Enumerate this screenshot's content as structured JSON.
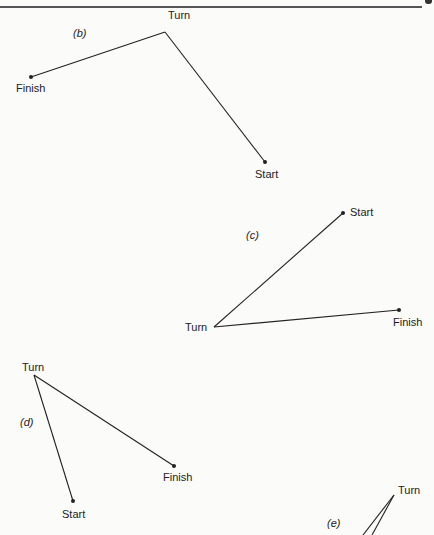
{
  "header": {
    "rule": true
  },
  "panels": [
    {
      "id": "b",
      "label": "(b)",
      "label_pos": [
        73,
        27
      ],
      "points": {
        "start": {
          "label": "Start",
          "x": 265,
          "y": 162,
          "label_pos": [
            255,
            168
          ]
        },
        "turn": {
          "label": "Turn",
          "x": 165,
          "y": 32,
          "label_pos": [
            168,
            9
          ]
        },
        "finish": {
          "label": "Finish",
          "x": 31,
          "y": 77,
          "label_pos": [
            16,
            82
          ]
        }
      }
    },
    {
      "id": "c",
      "label": "(c)",
      "label_pos": [
        246,
        229
      ],
      "points": {
        "start": {
          "label": "Start",
          "x": 343,
          "y": 213,
          "label_pos": [
            350,
            206
          ]
        },
        "turn": {
          "label": "Turn",
          "x": 214,
          "y": 327,
          "label_pos": [
            185,
            321
          ]
        },
        "finish": {
          "label": "Finish",
          "x": 399,
          "y": 310,
          "label_pos": [
            393,
            316
          ]
        }
      }
    },
    {
      "id": "d",
      "label": "(d)",
      "label_pos": [
        20,
        416
      ],
      "points": {
        "start": {
          "label": "Start",
          "x": 73,
          "y": 501,
          "label_pos": [
            62,
            508
          ]
        },
        "turn": {
          "label": "Turn",
          "x": 34,
          "y": 375,
          "label_pos": [
            22,
            361
          ]
        },
        "finish": {
          "label": "Finish",
          "x": 174,
          "y": 466,
          "label_pos": [
            163,
            471
          ]
        }
      }
    },
    {
      "id": "e",
      "label": "(e)",
      "label_pos": [
        327,
        517
      ],
      "points": {
        "turn": {
          "label": "Turn",
          "x": 394,
          "y": 495,
          "label_pos": [
            398,
            484
          ]
        },
        "leg1_end": {
          "x": 363,
          "y": 535
        },
        "leg2_end": {
          "x": 372,
          "y": 535
        }
      }
    }
  ],
  "colors": {
    "ink": "#222222",
    "paper": "#fbfbf9"
  }
}
